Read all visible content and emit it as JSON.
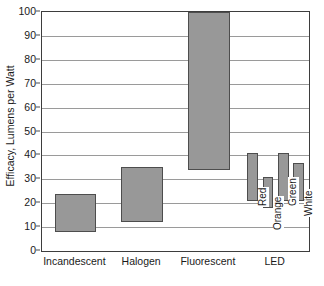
{
  "chart_data": {
    "type": "bar",
    "title": "",
    "xlabel": "",
    "ylabel": "Efficacy, Lumens per Watt",
    "ylim": [
      0,
      100
    ],
    "yticks": [
      0,
      10,
      20,
      30,
      40,
      50,
      60,
      70,
      80,
      90,
      100
    ],
    "grid": true,
    "legend": "none",
    "bar_style": "floating range bars (low to high)",
    "categories": [
      "Incandescent",
      "Halogen",
      "Fluorescent",
      "LED"
    ],
    "series": [
      {
        "name": "Efficacy range",
        "bars": [
          {
            "category": "Incandescent",
            "sub_label": "",
            "low": 8,
            "high": 24
          },
          {
            "category": "Halogen",
            "sub_label": "",
            "low": 12,
            "high": 35
          },
          {
            "category": "Fluorescent",
            "sub_label": "",
            "low": 34,
            "high": 100
          },
          {
            "category": "LED",
            "sub_label": "Red",
            "low": 21,
            "high": 41
          },
          {
            "category": "LED",
            "sub_label": "Orange",
            "low": 18,
            "high": 31
          },
          {
            "category": "LED",
            "sub_label": "Green",
            "low": 21,
            "high": 41
          },
          {
            "category": "LED",
            "sub_label": "White",
            "low": 21,
            "high": 37
          }
        ]
      }
    ],
    "colors": {
      "bar_fill": "#989898",
      "bar_edge": "#4d4d4d",
      "gridline": "#9a9a9a",
      "frame": "#3d3d3d",
      "text": "#1a1a1a",
      "background": "#ffffff"
    }
  }
}
